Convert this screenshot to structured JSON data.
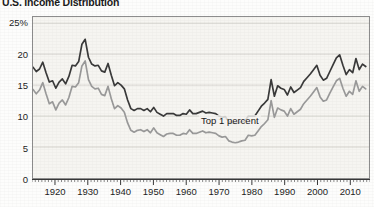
{
  "chart_title": "U.S. Income Distribution",
  "series_labels": {
    "top1": "Top 1 percent",
    "top05": "Top 0.5 percent"
  },
  "chart_data": {
    "type": "line",
    "title": "U.S. Income Distribution",
    "xlabel": "",
    "ylabel": "",
    "ylim": [
      0,
      26
    ],
    "xlim": [
      1913,
      2016
    ],
    "yticks": [
      0,
      5,
      10,
      15,
      20,
      25
    ],
    "ytick_labels": [
      "0",
      "5",
      "10",
      "15",
      "20",
      "25%"
    ],
    "xticks": [
      1920,
      1930,
      1940,
      1950,
      1960,
      1970,
      1980,
      1990,
      2000,
      2010
    ],
    "xtick_labels": [
      "1920",
      "1930",
      "1940",
      "1950",
      "1960",
      "1970",
      "1980",
      "1990",
      "2000",
      "2010"
    ],
    "minor_xtick_step": 1,
    "grid": "horizontal",
    "legend": "inline-annotations",
    "colors": {
      "top1": "#3a3a3a",
      "top05": "#9a9a9a",
      "plot_background": "#f6f5f1",
      "grid": "#c9c8c2",
      "frame": "#8d8d8d",
      "text": "#1e1e1e"
    },
    "x": [
      1913,
      1914,
      1915,
      1916,
      1917,
      1918,
      1919,
      1920,
      1921,
      1922,
      1923,
      1924,
      1925,
      1926,
      1927,
      1928,
      1929,
      1930,
      1931,
      1932,
      1933,
      1934,
      1935,
      1936,
      1937,
      1938,
      1939,
      1940,
      1941,
      1942,
      1943,
      1944,
      1945,
      1946,
      1947,
      1948,
      1949,
      1950,
      1951,
      1952,
      1953,
      1954,
      1955,
      1956,
      1957,
      1958,
      1959,
      1960,
      1961,
      1962,
      1963,
      1964,
      1965,
      1966,
      1967,
      1968,
      1969,
      1970,
      1971,
      1972,
      1973,
      1974,
      1975,
      1976,
      1977,
      1978,
      1979,
      1980,
      1981,
      1982,
      1983,
      1984,
      1985,
      1986,
      1987,
      1988,
      1989,
      1990,
      1991,
      1992,
      1993,
      1994,
      1995,
      1996,
      1997,
      1998,
      1999,
      2000,
      2001,
      2002,
      2003,
      2004,
      2005,
      2006,
      2007,
      2008,
      2009,
      2010,
      2011,
      2012,
      2013,
      2014,
      2015
    ],
    "series": [
      {
        "name": "Top 1 percent",
        "color": "#3a3a3a",
        "values": [
          17.9,
          17.2,
          17.6,
          18.7,
          17.0,
          15.5,
          15.7,
          14.5,
          15.5,
          16.0,
          15.2,
          16.4,
          18.2,
          18.1,
          18.8,
          21.6,
          22.4,
          19.5,
          18.4,
          18.1,
          18.2,
          17.3,
          17.1,
          18.5,
          16.6,
          14.9,
          15.4,
          15.0,
          14.4,
          12.6,
          11.2,
          10.9,
          11.2,
          11.2,
          10.9,
          11.2,
          10.7,
          11.4,
          10.6,
          10.3,
          10.0,
          10.4,
          10.4,
          10.4,
          10.1,
          10.1,
          10.4,
          10.3,
          11.0,
          10.4,
          10.4,
          10.6,
          10.8,
          10.5,
          10.6,
          10.5,
          10.4,
          10.0,
          9.8,
          9.9,
          9.1,
          8.9,
          8.8,
          8.9,
          9.1,
          9.2,
          10.0,
          10.0,
          10.0,
          10.8,
          11.6,
          12.1,
          12.7,
          15.9,
          13.2,
          14.9,
          14.5,
          14.3,
          13.4,
          14.7,
          13.8,
          14.2,
          14.6,
          15.6,
          16.2,
          16.8,
          17.5,
          18.2,
          16.6,
          15.8,
          16.1,
          17.2,
          18.3,
          19.4,
          19.9,
          18.2,
          16.7,
          17.5,
          17.0,
          19.3,
          17.5,
          18.4,
          18.0
        ]
      },
      {
        "name": "Top 0.5 percent",
        "color": "#9a9a9a",
        "values": [
          14.3,
          13.6,
          14.2,
          15.4,
          13.6,
          12.0,
          12.3,
          11.0,
          12.1,
          12.6,
          11.8,
          13.0,
          14.8,
          14.7,
          15.4,
          18.1,
          18.9,
          15.9,
          14.8,
          14.4,
          14.5,
          13.5,
          13.3,
          14.8,
          12.8,
          11.2,
          11.7,
          11.3,
          10.6,
          8.9,
          7.7,
          7.4,
          7.7,
          7.8,
          7.5,
          7.8,
          7.3,
          8.1,
          7.3,
          7.0,
          6.7,
          7.1,
          7.2,
          7.2,
          6.9,
          6.9,
          7.2,
          7.1,
          7.8,
          7.2,
          7.2,
          7.4,
          7.6,
          7.3,
          7.4,
          7.3,
          7.2,
          6.8,
          6.6,
          6.7,
          6.0,
          5.8,
          5.7,
          5.8,
          6.0,
          6.1,
          6.9,
          6.8,
          6.9,
          7.6,
          8.3,
          8.8,
          9.4,
          12.5,
          9.8,
          11.3,
          11.0,
          10.8,
          10.0,
          11.2,
          10.3,
          10.7,
          11.1,
          12.0,
          12.6,
          13.2,
          13.9,
          14.6,
          13.1,
          12.4,
          12.6,
          13.7,
          14.7,
          15.7,
          16.1,
          14.5,
          13.2,
          14.0,
          13.5,
          15.7,
          14.0,
          14.8,
          14.4
        ]
      }
    ]
  }
}
